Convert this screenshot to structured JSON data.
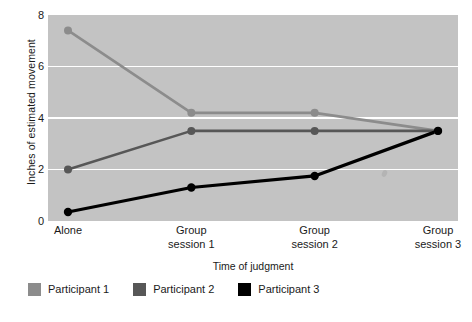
{
  "chart_data": {
    "type": "line",
    "title": "",
    "xlabel": "Time of judgment",
    "ylabel": "Inches of estimated movement",
    "categories": [
      "Alone",
      "Group\nsession 1",
      "Group\nsession 2",
      "Group\nsession 3"
    ],
    "category_lines": [
      [
        "Alone",
        ""
      ],
      [
        "Group",
        "session 1"
      ],
      [
        "Group",
        "session 2"
      ],
      [
        "Group",
        "session 3"
      ]
    ],
    "ylim": [
      0,
      8
    ],
    "yticks": [
      0,
      2,
      4,
      6,
      8
    ],
    "ytick_labels": [
      "0",
      "2",
      "4",
      "6",
      "8"
    ],
    "grid": "horizontal",
    "legend_position": "below",
    "plot_background": "#c3c3c3",
    "gridline_color": "#ffffff",
    "series": [
      {
        "name": "Participant 1",
        "color": "#8c8c8c",
        "values": [
          7.4,
          4.2,
          4.2,
          3.5
        ]
      },
      {
        "name": "Participant 2",
        "color": "#575757",
        "values": [
          2.0,
          3.5,
          3.5,
          3.5
        ]
      },
      {
        "name": "Participant 3",
        "color": "#000000",
        "values": [
          0.35,
          1.3,
          1.75,
          3.5
        ]
      }
    ]
  },
  "axis": {
    "ytick_labels": [
      "8",
      "6",
      "4",
      "2",
      "0"
    ],
    "ylabel": "Inches of estimated movement",
    "xlabel": "Time of judgment"
  },
  "legend": {
    "items": [
      {
        "label": "Participant 1",
        "color": "#8c8c8c"
      },
      {
        "label": "Participant 2",
        "color": "#575757"
      },
      {
        "label": "Participant 3",
        "color": "#000000"
      }
    ]
  }
}
